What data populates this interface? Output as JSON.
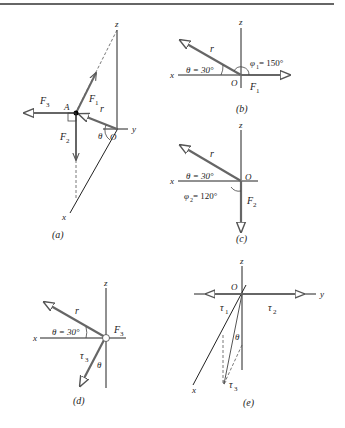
{
  "figure": {
    "panels": [
      {
        "id": "a",
        "caption": "(a)",
        "labels": {
          "z": "z",
          "y": "y",
          "x": "x",
          "origin": "O",
          "point": "A",
          "r": "r",
          "F1": "F",
          "F1sub": "1",
          "F2": "F",
          "F2sub": "2",
          "F3": "F",
          "F3sub": "3",
          "theta": "θ"
        }
      },
      {
        "id": "b",
        "caption": "(b)",
        "labels": {
          "z": "z",
          "x": "x",
          "origin": "O",
          "r": "r",
          "F1": "F",
          "F1sub": "1",
          "theta": "θ = 30°",
          "phi": "φ",
          "phisub": "1",
          "phival": " = 150°"
        }
      },
      {
        "id": "c",
        "caption": "(c)",
        "labels": {
          "z": "z",
          "x": "x",
          "origin": "O",
          "r": "r",
          "F2": "F",
          "F2sub": "2",
          "theta": "θ = 30°",
          "phi": "φ",
          "phisub": "2",
          "phival": " = 120°"
        }
      },
      {
        "id": "d",
        "caption": "(d)",
        "labels": {
          "z": "z",
          "x": "x",
          "r": "r",
          "F3": "F",
          "F3sub": "3",
          "tau": "τ",
          "tausub": "3",
          "theta": "θ = 30°",
          "theta2": "θ"
        }
      },
      {
        "id": "e",
        "caption": "(e)",
        "labels": {
          "z": "z",
          "y": "y",
          "x": "x",
          "origin": "O",
          "tau1": "τ",
          "tau1sub": "1",
          "tau2": "τ",
          "tau2sub": "2",
          "tau3": "τ",
          "tau3sub": "3",
          "theta": "θ"
        }
      }
    ],
    "colors": {
      "vector": "#6b6b6b",
      "axis": "#2a2a2a",
      "arrowhead": "#ffffff"
    }
  }
}
